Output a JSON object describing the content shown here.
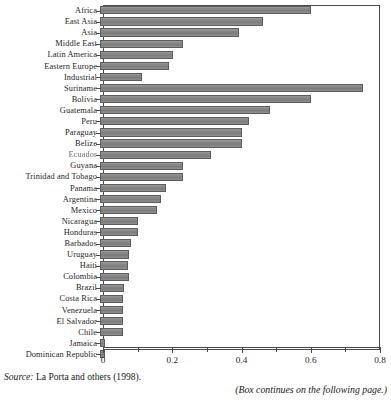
{
  "figure": {
    "source_prefix": "Source:",
    "source_text": "La Porta and others (1998).",
    "continues_note": "(Box continues on the following page.)"
  },
  "chart_data": {
    "type": "bar",
    "orientation": "horizontal",
    "title": "",
    "xlabel": "",
    "ylabel": "",
    "xlim": [
      0,
      0.8
    ],
    "grid": false,
    "legend": null,
    "tick_values": [
      0,
      0.1,
      0.2,
      0.3,
      0.4,
      0.5,
      0.6,
      0.7,
      0.8
    ],
    "tick_labels": [
      "0",
      "",
      "0.2",
      "",
      "0.4",
      "",
      "0.6",
      "",
      "0.8"
    ],
    "major_tick_labels": [
      "0",
      "0.2",
      "0.4",
      "0.6",
      "0.8"
    ],
    "bar_color": "#8a8a8a",
    "bar_edge_color": "#5c5c5c",
    "categories": [
      "Africa",
      "East Asia",
      "Asia",
      "Middle East",
      "Latin America",
      "Eastern Europe",
      "Industrial",
      "Suriname",
      "Bolivia",
      "Guatemala",
      "Peru",
      "Paraguay",
      "Belize",
      "Ecuador",
      "Guyana",
      "Trinidad and Tobago",
      "Panama",
      "Argentina",
      "Mexico",
      "Nicaragua",
      "Honduras",
      "Barbados",
      "Uruguay",
      "Haiti",
      "Colombia",
      "Brazil",
      "Costa Rica",
      "Venezuela",
      "El Salvador",
      "Chile",
      "Jamaica",
      "Dominican Republic"
    ],
    "values": [
      0.61,
      0.47,
      0.4,
      0.24,
      0.21,
      0.2,
      0.12,
      0.76,
      0.61,
      0.49,
      0.43,
      0.41,
      0.41,
      0.32,
      0.24,
      0.24,
      0.19,
      0.175,
      0.165,
      0.11,
      0.11,
      0.09,
      0.085,
      0.08,
      0.085,
      0.07,
      0.065,
      0.065,
      0.065,
      0.065,
      0.015,
      0.015
    ],
    "smudged_labels": [
      "Ecuador"
    ]
  }
}
